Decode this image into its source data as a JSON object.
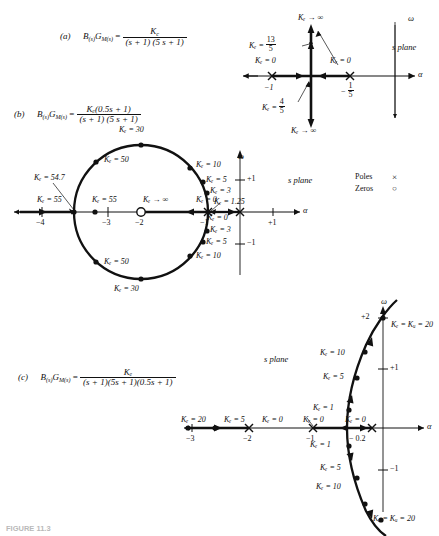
{
  "figure": {
    "caption": "FIGURE 11.3",
    "legend": {
      "poles_label": "Poles",
      "poles_symbol": "×",
      "zeros_label": "Zeros",
      "zeros_symbol": "○"
    },
    "axis_alpha": "α",
    "axis_omega": "ω",
    "s_plane": "s plane"
  },
  "panel_a": {
    "tag": "(a)",
    "lhs": "B",
    "lhs_sub": "(s)",
    "lhs2": "G",
    "lhs2_sub": "M(s)",
    "eq": "=",
    "numerator": "K",
    "numerator_sub": "c",
    "denominator": "(s + 1) (5 s + 1)",
    "s_plane": "s plane",
    "axis_alpha": "α",
    "axis_omega": "ω",
    "labels": {
      "kc_inf_top": "Kₑ → ∞",
      "kc_inf_bottom": "Kₑ → ∞",
      "kc_13_5": "Kₑ =",
      "kc_13_5_num": "13",
      "kc_13_5_den": "5",
      "kc_0_left": "Kₑ = 0",
      "kc_0_right": "Kₑ = 0",
      "kc_4_5": "Kₑ =",
      "kc_4_5_num": "4",
      "kc_4_5_den": "5",
      "tick_minus1": "−1",
      "tick_minus_fifth_num": "1",
      "tick_minus_fifth_den": "5",
      "tick_minus_fifth_sign": "−"
    }
  },
  "panel_b": {
    "tag": "(b)",
    "numerator": "Kₑ(0.5s + 1)",
    "denominator": "(s + 1) (5 s + 1)",
    "s_plane": "s plane",
    "axis_alpha": "α",
    "axis_omega": "ω",
    "ticks_real": [
      "−4",
      "−3",
      "−2",
      "−1",
      "+1"
    ],
    "ticks_imag": [
      "+1",
      "−1"
    ],
    "labels": {
      "kc_30_top": "Kₑ = 30",
      "kc_30_bottom": "Kₑ = 30",
      "kc_50_upper": "Kₑ = 50",
      "kc_50_lower": "Kₑ = 50",
      "kc_10_upper": "Kₑ = 10",
      "kc_10_lower": "Kₑ = 10",
      "kc_5_upper": "Kₑ = 5",
      "kc_5_lower": "Kₑ = 5",
      "kc_3_upper": "Kₑ = 3",
      "kc_3_lower": "Kₑ = 3",
      "kc_125": "Kₑ = 1.25",
      "kc_547": "Kₑ = 54.7",
      "kc_55_left": "Kₑ = 55",
      "kc_55_right": "Kₑ = 55",
      "kc_inf": "Kₑ → ∞",
      "kc_0_right": "Kₑ = 0",
      "kc_0_origin": "Kₑ = 0"
    }
  },
  "panel_c": {
    "tag": "(c)",
    "numerator": "Kₑ",
    "denominator": "(s + 1)(5s + 1)(0.5s + 1)",
    "s_plane": "s plane",
    "axis_alpha": "α",
    "axis_omega": "ω",
    "ticks_real": [
      "−3",
      "−2",
      "−1",
      "− 0.2"
    ],
    "ticks_imag": [
      "+2",
      "+1",
      "−1"
    ],
    "labels": {
      "kc_ku_top": "Kₑ = Kᵤ = 20",
      "kc_ku_bottom": "Kₑ = Kᵤ = 20",
      "kc_10_upper": "Kₑ = 10",
      "kc_10_lower": "Kₑ = 10",
      "kc_5_upper": "Kₑ = 5",
      "kc_5_lower": "Kₑ = 5",
      "kc_1_upper": "Kₑ = 1",
      "kc_1_lower": "Kₑ = 1",
      "kc_20_left": "Kₑ = 20",
      "kc_5_left": "Kₑ = 5",
      "kc_0_a": "Kₑ = 0",
      "kc_0_b": "Kₑ = 0",
      "kc_0_c": "Kₑ = 0"
    }
  }
}
